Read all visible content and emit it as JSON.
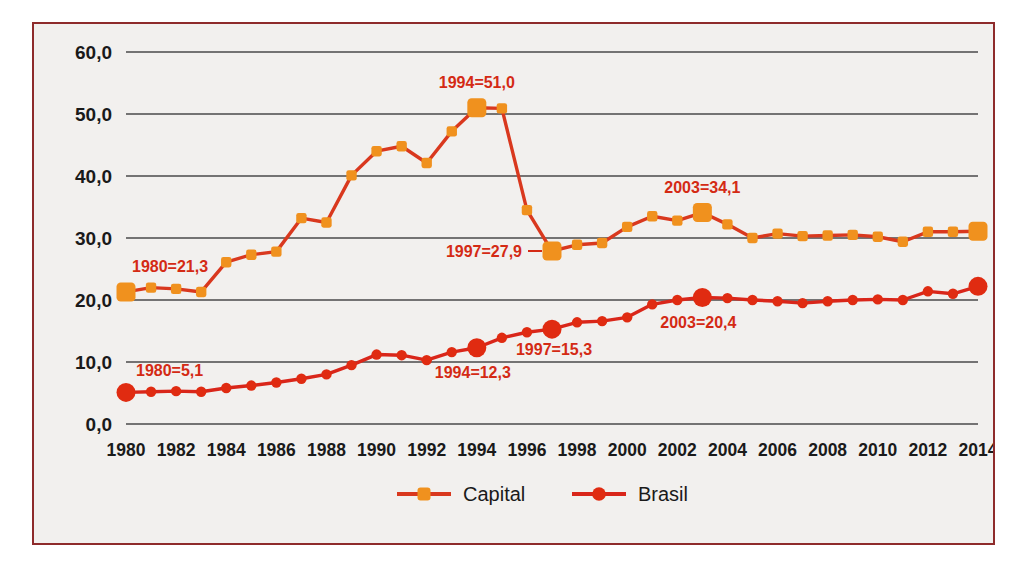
{
  "figure": {
    "background_color": "#f2f0ee",
    "border_color": "#8e2b2b"
  },
  "chart_data": {
    "type": "line",
    "title": "",
    "subtitle": "",
    "xlabel": "",
    "ylabel": "",
    "grid": true,
    "legend_position": "bottom",
    "xlim": [
      1980,
      2014
    ],
    "ylim": [
      0.0,
      60.0
    ],
    "ytick_labels": [
      "0,0",
      "10,0",
      "20,0",
      "30,0",
      "40,0",
      "50,0",
      "60,0"
    ],
    "ytick_values": [
      0,
      10,
      20,
      30,
      40,
      50,
      60
    ],
    "x": [
      1980,
      1981,
      1982,
      1983,
      1984,
      1985,
      1986,
      1987,
      1988,
      1989,
      1990,
      1991,
      1992,
      1993,
      1994,
      1995,
      1996,
      1997,
      1998,
      1999,
      2000,
      2001,
      2002,
      2003,
      2004,
      2005,
      2006,
      2007,
      2008,
      2009,
      2010,
      2011,
      2012,
      2013,
      2014
    ],
    "xtick_labels": [
      "1980",
      "1982",
      "1984",
      "1986",
      "1988",
      "1990",
      "1992",
      "1994",
      "1996",
      "1998",
      "2000",
      "2002",
      "2004",
      "2006",
      "2008",
      "2010",
      "2012",
      "2014"
    ],
    "xtick_values": [
      1980,
      1982,
      1984,
      1986,
      1988,
      1990,
      1992,
      1994,
      1996,
      1998,
      2000,
      2002,
      2004,
      2006,
      2008,
      2010,
      2012,
      2014
    ],
    "series": [
      {
        "name": "Capital",
        "color": "#f0911e",
        "line_color": "#d9381e",
        "marker": "square",
        "values": [
          21.3,
          22.0,
          21.8,
          21.3,
          26.1,
          27.3,
          27.8,
          33.2,
          32.5,
          40.1,
          44.0,
          44.8,
          42.1,
          47.2,
          51.0,
          50.9,
          34.5,
          27.9,
          28.9,
          29.2,
          31.8,
          33.5,
          32.8,
          34.1,
          32.2,
          30.0,
          30.7,
          30.3,
          30.4,
          30.5,
          30.2,
          29.4,
          31.0,
          31.0,
          31.1
        ]
      },
      {
        "name": "Brasil",
        "color": "#e02b11",
        "line_color": "#d9261a",
        "marker": "circle",
        "values": [
          5.1,
          5.2,
          5.3,
          5.2,
          5.8,
          6.2,
          6.7,
          7.3,
          8.0,
          9.5,
          11.2,
          11.1,
          10.3,
          11.6,
          12.3,
          13.9,
          14.8,
          15.3,
          16.4,
          16.6,
          17.2,
          19.3,
          20.0,
          20.4,
          20.3,
          20.0,
          19.8,
          19.5,
          19.8,
          20.0,
          20.1,
          20.0,
          21.4,
          21.0,
          22.2
        ]
      }
    ],
    "annotations": [
      {
        "text": "1980=21,3",
        "series": "Capital",
        "x": 1980,
        "value": 21.3,
        "color": "#d42a14",
        "placement": "above-left"
      },
      {
        "text": "1994=51,0",
        "series": "Capital",
        "x": 1994,
        "value": 51.0,
        "color": "#d42a14",
        "placement": "above"
      },
      {
        "text": "1997=27,9",
        "series": "Capital",
        "x": 1997,
        "value": 27.9,
        "color": "#d42a14",
        "placement": "left-leader"
      },
      {
        "text": "2003=34,1",
        "series": "Capital",
        "x": 2003,
        "value": 34.1,
        "color": "#d42a14",
        "placement": "above"
      },
      {
        "text": "1980=5,1",
        "series": "Brasil",
        "x": 1980,
        "value": 5.1,
        "color": "#d42a14",
        "placement": "above-right"
      },
      {
        "text": "1994=12,3",
        "series": "Brasil",
        "x": 1994,
        "value": 12.3,
        "color": "#d42a14",
        "placement": "below"
      },
      {
        "text": "1997=15,3",
        "series": "Brasil",
        "x": 1997,
        "value": 15.3,
        "color": "#d42a14",
        "placement": "below-right"
      },
      {
        "text": "2003=20,4",
        "series": "Brasil",
        "x": 2003,
        "value": 20.4,
        "color": "#d42a14",
        "placement": "below"
      }
    ],
    "highlighted_points": [
      {
        "series": "Capital",
        "x": 1980
      },
      {
        "series": "Capital",
        "x": 1994
      },
      {
        "series": "Capital",
        "x": 1997
      },
      {
        "series": "Capital",
        "x": 2003
      },
      {
        "series": "Capital",
        "x": 2014
      },
      {
        "series": "Brasil",
        "x": 1980
      },
      {
        "series": "Brasil",
        "x": 1994
      },
      {
        "series": "Brasil",
        "x": 1997
      },
      {
        "series": "Brasil",
        "x": 2003
      },
      {
        "series": "Brasil",
        "x": 2014
      }
    ]
  },
  "legend": {
    "items": [
      {
        "label": "Capital",
        "color": "#f0911e",
        "line_color": "#d9381e",
        "marker": "square"
      },
      {
        "label": "Brasil",
        "color": "#e02b11",
        "line_color": "#d9261a",
        "marker": "circle"
      }
    ]
  }
}
